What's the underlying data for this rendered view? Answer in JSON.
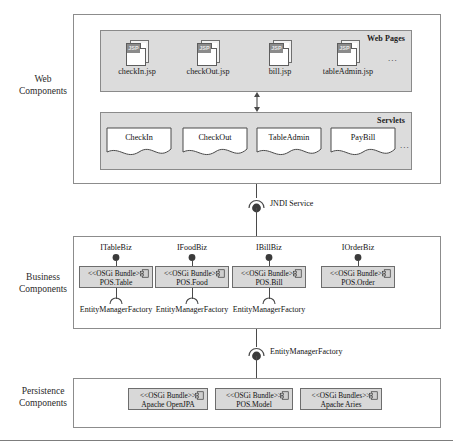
{
  "diagram": {
    "tiers": [
      {
        "id": "web",
        "label_line1": "Web",
        "label_line2": "Components"
      },
      {
        "id": "business",
        "label_line1": "Business",
        "label_line2": "Components"
      },
      {
        "id": "persistence",
        "label_line1": "Persistence",
        "label_line2": "Components"
      }
    ]
  },
  "web_tier": {
    "web_pages": {
      "title": "Web Pages",
      "ellipsis": "...",
      "pages": [
        {
          "icon": "jsp-file-icon",
          "badge": "JSP",
          "name": "checkIn.jsp"
        },
        {
          "icon": "jsp-file-icon",
          "badge": "JSP",
          "name": "checkOut.jsp"
        },
        {
          "icon": "jsp-file-icon",
          "badge": "JSP",
          "name": "bill.jsp"
        },
        {
          "icon": "jsp-file-icon",
          "badge": "JSP",
          "name": "tableAdmin.jsp"
        }
      ]
    },
    "servlets": {
      "title": "Servlets",
      "ellipsis": "...",
      "items": [
        {
          "name": "CheckIn"
        },
        {
          "name": "CheckOut"
        },
        {
          "name": "TableAdmin"
        },
        {
          "name": "PayBill"
        }
      ]
    }
  },
  "connectors": {
    "jndi": {
      "label": "JNDI Service",
      "kind": "ball-and-socket"
    },
    "emf": {
      "label": "EntityManagerFactory",
      "kind": "ball-and-socket"
    }
  },
  "business_tier": {
    "components": [
      {
        "interface": "ITableBiz",
        "stereotype": "<<OSGi Bundle>>",
        "name": "POS.Table",
        "icon": "component-icon",
        "required": "EntityManagerFactory"
      },
      {
        "interface": "IFoodBiz",
        "stereotype": "<<OSGi Bundle>>",
        "name": "POS.Food",
        "icon": "component-icon",
        "required": "EntityManagerFactory"
      },
      {
        "interface": "IBillBiz",
        "stereotype": "<<OSGi Bundle>>",
        "name": "POS.Bill",
        "icon": "component-icon",
        "required": "EntityManagerFactory"
      },
      {
        "interface": "IOrderBiz",
        "stereotype": "<<OSGi Bundle>>",
        "name": "POS.Order",
        "icon": "component-icon",
        "required": ""
      }
    ]
  },
  "persistence_tier": {
    "components": [
      {
        "stereotype": "<<OSGi Bundle>>",
        "name": "Apache OpenJPA",
        "icon": "component-icon"
      },
      {
        "stereotype": "<<OSGi Bundle>>",
        "name": "POS.Model",
        "icon": "component-icon"
      },
      {
        "stereotype": "<<OSGi Bundles>>",
        "name": "Apache Aries",
        "icon": "component-icon"
      }
    ]
  },
  "colors": {
    "group_fill": "#dcdcdc",
    "bundle_fill": "#d8d8d8",
    "line": "#4a4a4a",
    "frame": "#8c8c8c",
    "jsp_badge": "#8b8b8b"
  }
}
